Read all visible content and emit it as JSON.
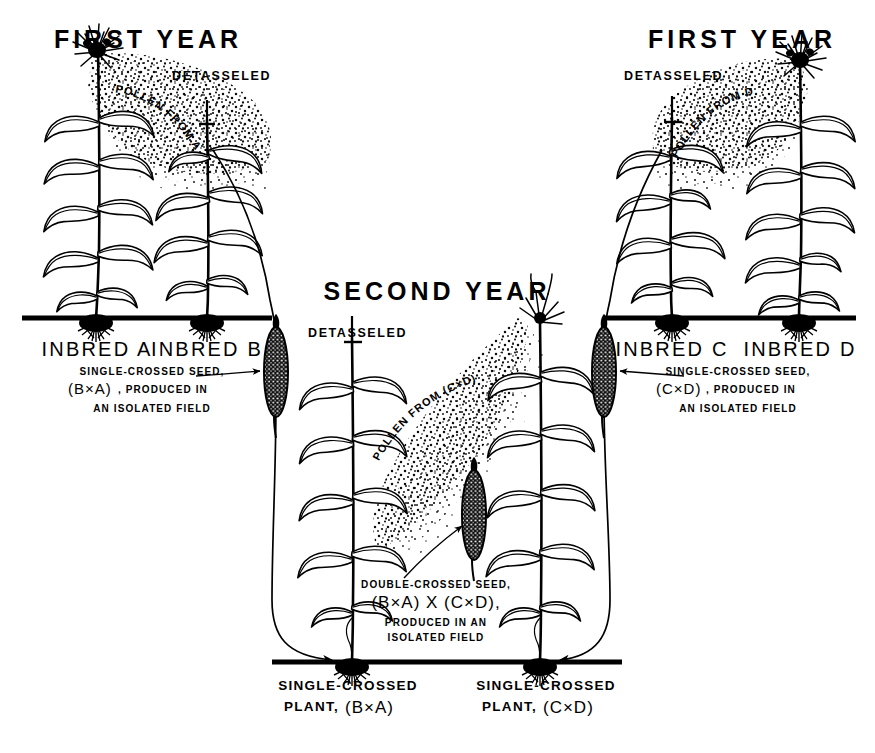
{
  "diagram": {
    "background_color": "#ffffff",
    "ink_color": "#000000"
  },
  "panels": {
    "first_year_left": {
      "title": "FIRST YEAR",
      "detasseled_label": "DETASSELED",
      "pollen_label": "POLLEN FROM A",
      "plant_left_label": "INBRED A",
      "plant_right_label": "INBRED B",
      "caption_line1": "SINGLE-CROSSED SEED,",
      "caption_line2_paren": "(B×A)",
      "caption_line2_rest": ", PRODUCED IN",
      "caption_line3": "AN ISOLATED FIELD"
    },
    "first_year_right": {
      "title": "FIRST YEAR",
      "detasseled_label": "DETASSELED",
      "pollen_label": "POLLEN FROM D",
      "plant_left_label": "INBRED C",
      "plant_right_label": "INBRED D",
      "caption_line1": "SINGLE-CROSSED SEED,",
      "caption_line2_paren": "(C×D)",
      "caption_line2_rest": ", PRODUCED IN",
      "caption_line3": "AN ISOLATED FIELD"
    },
    "second_year": {
      "title": "SECOND YEAR",
      "detasseled_label": "DETASSELED",
      "pollen_label": "POLLEN FROM (C×D)",
      "caption_line1": "DOUBLE-CROSSED SEED,",
      "caption_line2": "(B×A) X (C×D),",
      "caption_line3": "PRODUCED IN AN",
      "caption_line4": "ISOLATED FIELD",
      "plant_left_label_line1": "SINGLE-CROSSED",
      "plant_left_label_line2_pre": "PLANT,",
      "plant_left_label_line2_paren": "(B×A)",
      "plant_right_label_line1": "SINGLE-CROSSED",
      "plant_right_label_line2_pre": "PLANT,",
      "plant_right_label_line2_paren": "(C×D)"
    }
  },
  "icons": {
    "tassel": "corn-tassel-icon",
    "ear": "corn-ear-icon",
    "roots": "corn-roots-icon",
    "pollen_cloud": "pollen-cloud-icon",
    "arrow": "flow-arrow-icon",
    "detassel_cut": "detasseled-stalk-icon"
  }
}
